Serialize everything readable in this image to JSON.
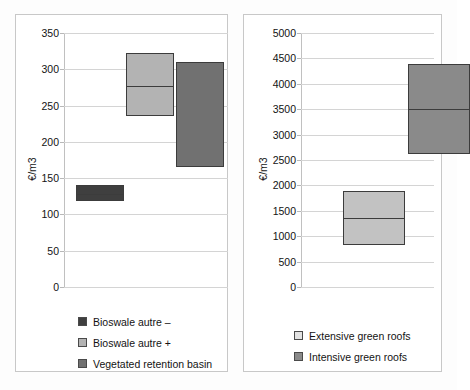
{
  "chart_data": [
    {
      "id": "left",
      "type": "bar",
      "subtype": "floating-range-box",
      "title": "",
      "xlabel": "",
      "ylabel": "€/m3",
      "ylim": [
        0,
        350
      ],
      "ytick_step": 50,
      "yticks": [
        0,
        50,
        100,
        150,
        200,
        250,
        300,
        350
      ],
      "grid": true,
      "legend_position": "bottom",
      "categories": [
        "Bioswale autre –",
        "Bioswale autre +",
        "Vegetated retention basin"
      ],
      "boxes": [
        {
          "label": "Bioswale autre –",
          "low": 118,
          "high": 140,
          "median": 129,
          "color": "#3f3f3f"
        },
        {
          "label": "Bioswale autre +",
          "low": 236,
          "high": 322,
          "median": 279,
          "color": "#b3b3b3"
        },
        {
          "label": "Vegetated retention basin",
          "low": 165,
          "high": 310,
          "median": null,
          "color": "#717171"
        }
      ],
      "legend": [
        {
          "label": "Bioswale autre –",
          "color": "#3f3f3f"
        },
        {
          "label": "Bioswale autre +",
          "color": "#b3b3b3"
        },
        {
          "label": "Vegetated retention basin",
          "color": "#717171"
        }
      ]
    },
    {
      "id": "right",
      "type": "bar",
      "subtype": "floating-range-box",
      "title": "",
      "xlabel": "",
      "ylabel": "€/m3",
      "ylim": [
        0,
        5000
      ],
      "ytick_step": 500,
      "yticks": [
        0,
        500,
        1000,
        1500,
        2000,
        2500,
        3000,
        3500,
        4000,
        4500,
        5000
      ],
      "grid": true,
      "legend_position": "bottom",
      "categories": [
        "Extensive green roofs",
        "Intensive green roofs"
      ],
      "boxes": [
        {
          "label": "Extensive green roofs",
          "low": 820,
          "high": 1880,
          "median": 1370,
          "color": "#c2c2c2"
        },
        {
          "label": "Intensive green roofs",
          "low": 2620,
          "high": 4390,
          "median": 3520,
          "color": "#8a8a8a"
        }
      ],
      "legend": [
        {
          "label": "Extensive green roofs",
          "color": "#e2e2e2"
        },
        {
          "label": "Intensive green roofs",
          "color": "#8a8a8a"
        }
      ]
    }
  ],
  "left_panel": {
    "axis_title": "€/m3",
    "ticks": [
      "350",
      "300",
      "250",
      "200",
      "150",
      "100",
      "50",
      "0"
    ],
    "legend": [
      {
        "label": "Bioswale autre –",
        "color": "#3f3f3f"
      },
      {
        "label": "Bioswale autre +",
        "color": "#b3b3b3"
      },
      {
        "label": "Vegetated retention basin",
        "color": "#717171"
      }
    ]
  },
  "right_panel": {
    "axis_title": "€/m3",
    "ticks": [
      "5000",
      "4500",
      "4000",
      "3500",
      "3000",
      "2500",
      "2000",
      "1500",
      "1000",
      "500",
      "0"
    ],
    "legend": [
      {
        "label": "Extensive green roofs",
        "color": "#e2e2e2"
      },
      {
        "label": "Intensive green roofs",
        "color": "#8a8a8a"
      }
    ]
  }
}
